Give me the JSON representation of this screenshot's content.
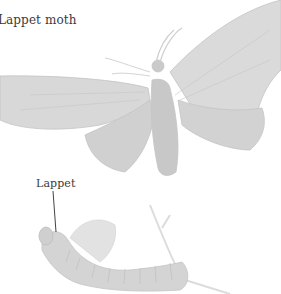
{
  "labels": {
    "title": "Lappet moth",
    "callout": "Lappet"
  },
  "colors": {
    "background": "#ffffff",
    "illustration": "#cfcfcf",
    "illustration_light": "#e2e2e2",
    "text": "#3a3a3a"
  },
  "figures": [
    {
      "name": "adult-moth",
      "description": "adult lappet moth with wings spread"
    },
    {
      "name": "caterpillar",
      "description": "lappet moth caterpillar on a twig"
    }
  ]
}
